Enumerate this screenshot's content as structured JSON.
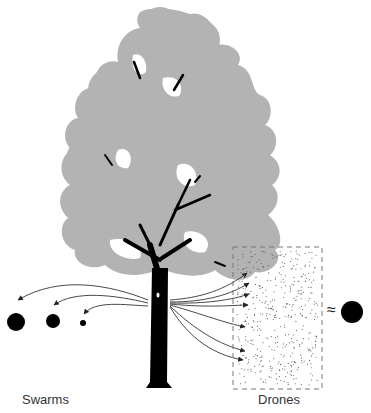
{
  "figure": {
    "labels": {
      "left": "Swarms",
      "right": "Drones",
      "approx_symbol": "≈"
    },
    "colors": {
      "canopy": "#b3b3b3",
      "trunk": "#000000",
      "arrows": "#333333",
      "dots": "#555555",
      "box_border": "#777777",
      "circles": "#000000"
    },
    "swarm_circles": [
      {
        "cx": 16,
        "cy": 322,
        "r": 9
      },
      {
        "cx": 53,
        "cy": 321,
        "r": 7
      },
      {
        "cx": 83,
        "cy": 323,
        "r": 3
      }
    ],
    "equivalent_circle": {
      "cx": 352,
      "cy": 312,
      "r": 11
    },
    "drone_box": {
      "x": 233,
      "y": 247,
      "w": 89,
      "h": 142
    }
  }
}
